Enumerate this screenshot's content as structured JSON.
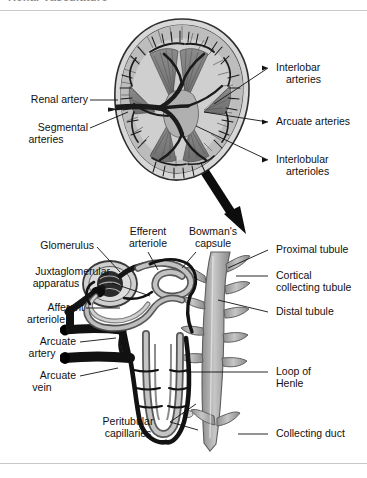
{
  "page": {
    "header_title": "Renal Vasculature",
    "background": "#ffffff",
    "width": 367,
    "height": 478
  },
  "figure": {
    "panels": [
      {
        "name": "kidney-cross-section",
        "caption": "Coronal section of kidney showing arterial supply"
      },
      {
        "name": "nephron-detail",
        "caption": "Detail of a single nephron with its blood supply"
      }
    ],
    "connector": "zoom-arrow"
  },
  "colors": {
    "vessel_dark": "#1a1a1a",
    "tubule_gray": "#9a9a9a",
    "tissue_light": "#c9c9c9",
    "tissue_mid": "#8f8f8f",
    "outline": "#3a3a3a",
    "label_text": "#111111",
    "rule": "#c9c9c9"
  },
  "kidney_labels": {
    "left": [
      {
        "id": "renal-artery",
        "text": "Renal artery"
      },
      {
        "id": "segmental-arteries",
        "line1": "Segmental",
        "line2": "arteries"
      }
    ],
    "right": [
      {
        "id": "interlobar-arteries",
        "line1": "Interlobar",
        "line2": "arteries"
      },
      {
        "id": "arcuate-arteries",
        "line1": "Arcuate arteries",
        "line2": ""
      },
      {
        "id": "interlobular-arterioles",
        "line1": "Interlobular",
        "line2": "arterioles"
      }
    ]
  },
  "nephron_labels": {
    "top": [
      {
        "id": "efferent-arteriole",
        "line1": "Efferent",
        "line2": "arteriole"
      },
      {
        "id": "bowmans-capsule",
        "line1": "Bowman's",
        "line2": "capsule"
      }
    ],
    "left": [
      {
        "id": "glomerulus",
        "line1": "Glomerulus",
        "line2": ""
      },
      {
        "id": "juxtaglomerular-apparatus",
        "line1": "Juxtaglomerular",
        "line2": "apparatus"
      },
      {
        "id": "afferent-arteriole",
        "line1": "Afferent",
        "line2": "arteriole"
      },
      {
        "id": "arcuate-artery",
        "line1": "Arcuate",
        "line2": "artery"
      },
      {
        "id": "arcuate-vein",
        "line1": "Arcuate",
        "line2": "vein"
      },
      {
        "id": "peritubular-capillaries",
        "line1": "Peritubular",
        "line2": "capillaries"
      }
    ],
    "right": [
      {
        "id": "proximal-tubule",
        "line1": "Proximal tubule",
        "line2": ""
      },
      {
        "id": "cortical-collecting-tubule",
        "line1": "Cortical",
        "line2": "collecting tubule"
      },
      {
        "id": "distal-tubule",
        "line1": "Distal tubule",
        "line2": ""
      },
      {
        "id": "loop-of-henle",
        "line1": "Loop of",
        "line2": "Henle"
      },
      {
        "id": "collecting-duct",
        "line1": "Collecting duct",
        "line2": ""
      }
    ]
  }
}
